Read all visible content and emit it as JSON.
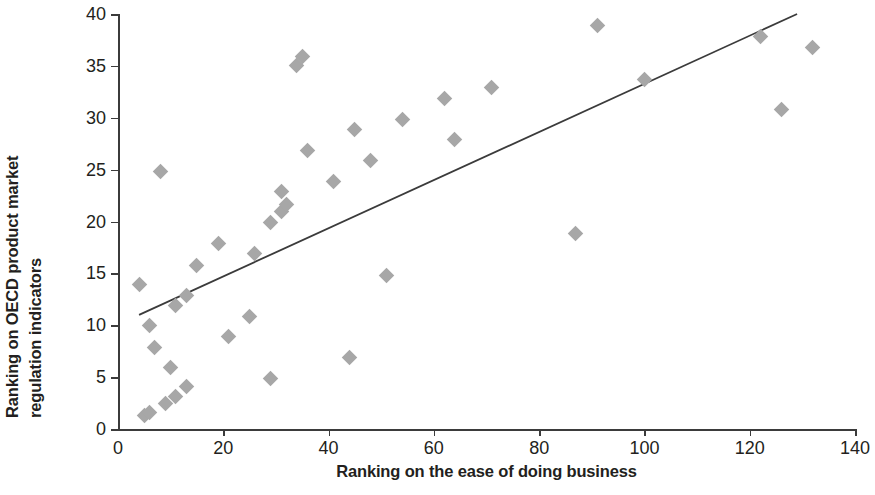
{
  "chart_data": {
    "type": "scatter",
    "title": "",
    "xlabel": "Ranking on the ease of doing business",
    "ylabel": "Ranking on OECD product market regulation indicators",
    "ylabel_lines": [
      "Ranking on OECD product market",
      "regulation indicators"
    ],
    "xlim": [
      0,
      140
    ],
    "ylim": [
      0,
      40
    ],
    "xticks": [
      0,
      20,
      40,
      60,
      80,
      100,
      120,
      140
    ],
    "yticks": [
      0,
      5,
      10,
      15,
      20,
      25,
      30,
      35,
      40
    ],
    "grid": false,
    "legend": null,
    "marker": "diamond",
    "marker_color": "#a7a7a7",
    "trendline": {
      "type": "linear",
      "color": "#3b3b3b",
      "x_start": 4,
      "y_start": 11.0,
      "x_end": 129,
      "y_end": 40.0
    },
    "points": [
      {
        "x": 4,
        "y": 13.9
      },
      {
        "x": 5,
        "y": 1.3
      },
      {
        "x": 6,
        "y": 1.6
      },
      {
        "x": 6,
        "y": 10.0
      },
      {
        "x": 7,
        "y": 7.9
      },
      {
        "x": 8,
        "y": 24.8
      },
      {
        "x": 9,
        "y": 2.5
      },
      {
        "x": 10,
        "y": 5.9
      },
      {
        "x": 11,
        "y": 3.1
      },
      {
        "x": 11,
        "y": 11.9
      },
      {
        "x": 13,
        "y": 4.1
      },
      {
        "x": 13,
        "y": 12.9
      },
      {
        "x": 15,
        "y": 15.8
      },
      {
        "x": 19,
        "y": 17.9
      },
      {
        "x": 21,
        "y": 8.9
      },
      {
        "x": 25,
        "y": 10.8
      },
      {
        "x": 26,
        "y": 16.9
      },
      {
        "x": 29,
        "y": 4.9
      },
      {
        "x": 29,
        "y": 19.9
      },
      {
        "x": 31,
        "y": 22.9
      },
      {
        "x": 31,
        "y": 21.0
      },
      {
        "x": 32,
        "y": 21.6
      },
      {
        "x": 34,
        "y": 35.0
      },
      {
        "x": 35,
        "y": 35.9
      },
      {
        "x": 36,
        "y": 26.8
      },
      {
        "x": 41,
        "y": 23.9
      },
      {
        "x": 44,
        "y": 6.9
      },
      {
        "x": 45,
        "y": 28.9
      },
      {
        "x": 48,
        "y": 25.9
      },
      {
        "x": 51,
        "y": 14.8
      },
      {
        "x": 54,
        "y": 29.8
      },
      {
        "x": 62,
        "y": 31.9
      },
      {
        "x": 64,
        "y": 27.9
      },
      {
        "x": 71,
        "y": 32.9
      },
      {
        "x": 87,
        "y": 18.8
      },
      {
        "x": 91,
        "y": 38.9
      },
      {
        "x": 100,
        "y": 33.7
      },
      {
        "x": 122,
        "y": 37.8
      },
      {
        "x": 126,
        "y": 30.8
      },
      {
        "x": 132,
        "y": 36.8
      }
    ]
  }
}
